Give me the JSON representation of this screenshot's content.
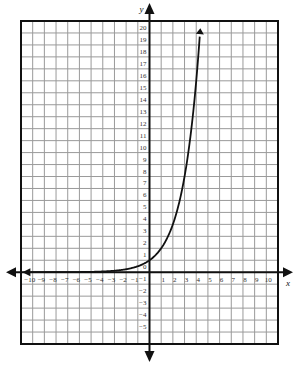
{
  "chart_data": {
    "type": "line",
    "title": "",
    "xlabel": "x",
    "ylabel": "y",
    "xlim": [
      -11,
      11
    ],
    "ylim": [
      -6,
      21
    ],
    "grid": true,
    "x_ticks": [
      -10,
      -9,
      -8,
      -7,
      -6,
      -5,
      -4,
      -3,
      -2,
      -1,
      1,
      2,
      3,
      4,
      5,
      6,
      7,
      8,
      9,
      10
    ],
    "y_ticks": [
      20,
      19,
      18,
      17,
      16,
      15,
      14,
      13,
      12,
      11,
      10,
      9,
      8,
      7,
      6,
      5,
      4,
      3,
      2,
      1,
      0,
      -1,
      -2,
      -3,
      -4,
      -5
    ],
    "series": [
      {
        "name": "y = 2^x",
        "function": "2^x",
        "x": [
          -10,
          -8,
          -6,
          -4,
          -3,
          -2,
          -1,
          0,
          1,
          2,
          3,
          4,
          4.32
        ],
        "y": [
          0.001,
          0.004,
          0.016,
          0.0625,
          0.125,
          0.25,
          0.5,
          1,
          2,
          4,
          8,
          16,
          20
        ],
        "arrow_ends": [
          "left",
          "top"
        ]
      }
    ]
  },
  "colors": {
    "grid": "#9a9a9a",
    "axis": "#111111",
    "curve": "#111111",
    "background": "#ffffff"
  }
}
